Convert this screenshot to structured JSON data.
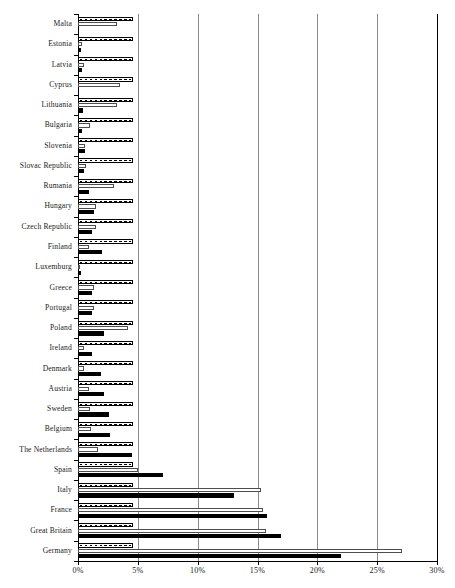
{
  "chart_data": {
    "type": "bar",
    "orientation": "horizontal",
    "title": "",
    "subtitle": "",
    "xlabel": "",
    "ylabel": "",
    "xlim": [
      0,
      30
    ],
    "xticks": [
      0,
      5,
      10,
      15,
      20,
      25,
      30
    ],
    "xtick_labels": [
      "0%",
      "5%",
      "10%",
      "15%",
      "20%",
      "25%",
      "30%"
    ],
    "unit": "%",
    "grid": "vertical",
    "legend_position": "none",
    "legend_entries": [],
    "categories": [
      "Malta",
      "Estonia",
      "Latvia",
      "Cyprus",
      "Lithuania",
      "Bulgaria",
      "Slovenia",
      "Slovac Republic",
      "Rumania",
      "Hungary",
      "Czech Republic",
      "Finland",
      "Luxemburg",
      "Greece",
      "Portugal",
      "Poland",
      "Ireland",
      "Denmark",
      "Austria",
      "Sweden",
      "Belgium",
      "The Netherlands",
      "Spain",
      "Italy",
      "France",
      "Great Britain",
      "Germany"
    ],
    "series": [
      {
        "name": "series-checkered",
        "style": "checkered",
        "values": [
          4.6,
          4.6,
          4.6,
          4.6,
          4.6,
          4.6,
          4.6,
          4.6,
          4.6,
          4.6,
          4.6,
          4.6,
          4.6,
          4.6,
          4.6,
          4.6,
          4.6,
          4.6,
          4.6,
          4.6,
          4.6,
          4.6,
          4.6,
          4.6,
          4.6,
          4.6,
          4.6
        ]
      },
      {
        "name": "series-white",
        "style": "white-outline",
        "values": [
          3.3,
          0.3,
          0.5,
          3.5,
          3.3,
          1.0,
          0.6,
          0.7,
          3.0,
          1.5,
          1.5,
          0.9,
          0.2,
          1.3,
          1.3,
          4.2,
          0.5,
          0.5,
          0.9,
          1.0,
          1.1,
          1.7,
          5.0,
          15.3,
          15.5,
          15.7,
          27.1
        ]
      },
      {
        "name": "series-black",
        "style": "solid-black",
        "values": [
          0.05,
          0.25,
          0.3,
          0.05,
          0.45,
          0.35,
          0.6,
          0.5,
          0.9,
          1.3,
          1.2,
          2.0,
          0.25,
          1.2,
          1.2,
          2.2,
          1.2,
          1.9,
          2.2,
          2.6,
          2.7,
          4.5,
          7.1,
          13.0,
          15.8,
          17.0,
          22.0
        ]
      }
    ]
  }
}
